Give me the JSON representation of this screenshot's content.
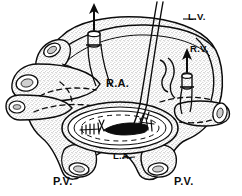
{
  "figure": {
    "style": "black and white stippled line drawing",
    "background_color": "#ffffff",
    "ink_color": "#0d0d0d",
    "stipple_color": "#555555"
  },
  "labels": {
    "left_ventricle": "L.V.",
    "right_ventricle": "R.V.",
    "right_atrium": "R.A.",
    "left_atrium": "L.A.",
    "pulmonary_vein_left": "P.V.",
    "pulmonary_vein_right": "P.V."
  },
  "annotations": {
    "arrow_superior_count": 2,
    "cannula_count": 2,
    "suture_threads": 2,
    "vessel_stumps_left": 3,
    "vessel_stumps_right": 1,
    "vessel_stumps_bottom": 2
  }
}
